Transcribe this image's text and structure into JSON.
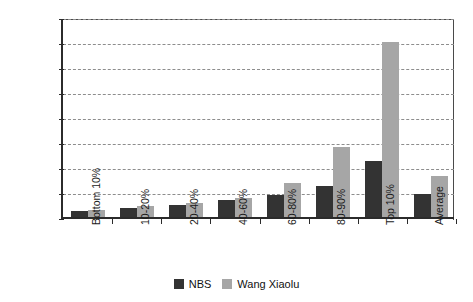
{
  "chart_data": {
    "type": "bar",
    "title": "",
    "xlabel": "",
    "ylabel": "",
    "ylim": [
      0,
      160000
    ],
    "ytick_step": 20000,
    "grid": true,
    "legend_position": "bottom",
    "categories": [
      "Bottom 10%",
      "10-20%",
      "20-40%",
      "40-60%",
      "60-80%",
      "80-90%",
      "Top 10%",
      "Average"
    ],
    "yticks": [
      "0",
      "20000",
      "40000",
      "60000",
      "80000",
      "100000",
      "120000",
      "140000",
      "160000"
    ],
    "series": [
      {
        "name": "NBS",
        "color": "#333333",
        "values": [
          5000,
          7500,
          9500,
          13500,
          18000,
          25000,
          45000,
          18500
        ]
      },
      {
        "name": "Wang Xiaolu",
        "color": "#a6a6a6",
        "values": [
          6000,
          8500,
          11500,
          15500,
          27000,
          56000,
          140000,
          33000
        ]
      }
    ]
  },
  "legend": {
    "items": [
      {
        "label": "NBS",
        "color": "#333333"
      },
      {
        "label": "Wang Xiaolu",
        "color": "#a6a6a6"
      }
    ]
  }
}
